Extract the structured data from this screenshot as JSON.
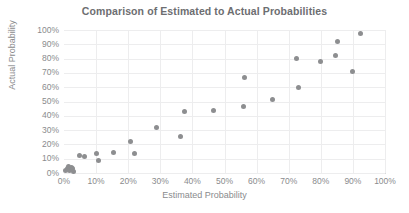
{
  "chart_data": {
    "type": "scatter",
    "title": "Comparison of Estimated to Actual Probabilities",
    "xlabel": "Estimated Probability",
    "ylabel": "Actual Probability",
    "xlim": [
      0,
      100
    ],
    "ylim": [
      0,
      100
    ],
    "grid": true,
    "legend": null,
    "xticks": [
      "0%",
      "10%",
      "20%",
      "30%",
      "40%",
      "50%",
      "60%",
      "70%",
      "80%",
      "90%",
      "100%"
    ],
    "yticks": [
      "0%",
      "10%",
      "20%",
      "30%",
      "40%",
      "50%",
      "60%",
      "70%",
      "80%",
      "90%",
      "100%"
    ],
    "xtick_values": [
      0,
      10,
      20,
      30,
      40,
      50,
      60,
      70,
      80,
      90,
      100
    ],
    "ytick_values": [
      0,
      10,
      20,
      30,
      40,
      50,
      60,
      70,
      80,
      90,
      100
    ],
    "point_color": "#8d8e90",
    "grid_color": "#ededee",
    "axis_color": "#d8d9da",
    "text_color": "#8a8b8d",
    "title_color": "#6d6e71",
    "series": [
      {
        "name": "Estimated vs Actual",
        "points": [
          [
            0.5,
            1.5
          ],
          [
            1.0,
            3.0
          ],
          [
            1.3,
            4.5
          ],
          [
            1.8,
            2.0
          ],
          [
            2.2,
            4.0
          ],
          [
            2.6,
            3.2
          ],
          [
            3.0,
            1.2
          ],
          [
            4.8,
            12.0
          ],
          [
            6.4,
            11.3
          ],
          [
            10.2,
            13.5
          ],
          [
            10.6,
            8.5
          ],
          [
            15.5,
            14.5
          ],
          [
            20.8,
            22.0
          ],
          [
            22.0,
            13.3
          ],
          [
            28.8,
            31.5
          ],
          [
            36.3,
            25.5
          ],
          [
            37.6,
            43.0
          ],
          [
            46.5,
            43.5
          ],
          [
            55.8,
            46.3
          ],
          [
            56.3,
            66.8
          ],
          [
            64.8,
            51.5
          ],
          [
            72.3,
            80.3
          ],
          [
            73.2,
            59.7
          ],
          [
            80.0,
            78.0
          ],
          [
            84.7,
            82.3
          ],
          [
            85.2,
            92.3
          ],
          [
            89.8,
            70.8
          ],
          [
            92.3,
            97.3
          ]
        ]
      }
    ]
  }
}
